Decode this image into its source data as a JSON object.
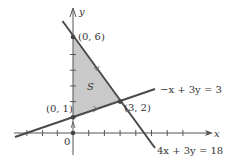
{
  "diagram": {
    "origin_px": [
      73,
      133
    ],
    "unit_px": 15.7,
    "colors": {
      "axis": "#555555",
      "line": "#4a4a4a",
      "region_fill": "#c9c9c9",
      "point": "#444444",
      "text": "#333333"
    },
    "axes": {
      "x_label": "x",
      "y_label": "y",
      "origin_label": "0",
      "x_ticks": [
        -4,
        -3,
        -2,
        -1,
        1,
        2,
        3,
        4,
        5,
        6,
        7
      ],
      "y_ticks": [
        1,
        2,
        3,
        4,
        5
      ]
    },
    "lines": [
      {
        "equation": "−x + 3y = 3",
        "name": "constraint-line-1"
      },
      {
        "equation": "4x + 3y = 18",
        "name": "constraint-line-2"
      }
    ],
    "region": {
      "label": "S",
      "vertices": [
        [
          0,
          1
        ],
        [
          0,
          6
        ],
        [
          3,
          2
        ]
      ]
    },
    "points": [
      {
        "label": "(0, 6)",
        "x": 0,
        "y": 6
      },
      {
        "label": "(0, 1)",
        "x": 0,
        "y": 1
      },
      {
        "label": "(3, 2)",
        "x": 3,
        "y": 2
      }
    ]
  }
}
